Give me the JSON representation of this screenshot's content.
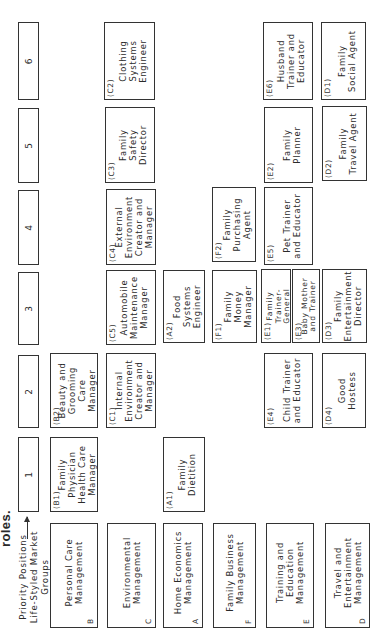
{
  "title": "roles.",
  "axis": {
    "label": "Priority Positions\nLife-Styled Market\nGroups"
  },
  "priorities": [
    "1",
    "2",
    "3",
    "4",
    "5",
    "6"
  ],
  "groups": [
    {
      "code": "B",
      "name": "Personal Care\nManagement"
    },
    {
      "code": "C",
      "name": "Environmental\nManagement"
    },
    {
      "code": "A",
      "name": "Home Economics\nManagement"
    },
    {
      "code": "F",
      "name": "Family Business\nManagement"
    },
    {
      "code": "E",
      "name": "Training and\nEducation\nManagement"
    },
    {
      "code": "D",
      "name": "Travel and\nEntertainment\nManagement"
    }
  ],
  "roles": {
    "B1": {
      "code": "(B1)",
      "name": "Family\nPhysician\nHealth Care\nManager"
    },
    "B2": {
      "code": "(B2)",
      "name": "Beauty and\nGrooming\nCare Manager"
    },
    "C1": {
      "code": "(C1)",
      "name": "Internal\nEnvironment\nCreator and\nManager"
    },
    "C5": {
      "code": "(C5)",
      "name": "Automobile\nMaintenance\nManager"
    },
    "C4": {
      "code": "(C4)",
      "name": "External\nEnvironment\nCreator and\nManager"
    },
    "C3": {
      "code": "(C3)",
      "name": "Family\nSafety\nDirector"
    },
    "C2": {
      "code": "(C2)",
      "name": "Clothing\nSystems\nEngineer"
    },
    "A1": {
      "code": "(A1)",
      "name": "Family\nDietition"
    },
    "A2": {
      "code": "(A2)",
      "name": "Food\nSystems\nEngineer"
    },
    "F1": {
      "code": "(F1)",
      "name": "Family\nMoney\nManager"
    },
    "F2": {
      "code": "(F2)",
      "name": "Family\nPurchasing\nAgent"
    },
    "E4": {
      "code": "(E4)",
      "name": "Child Trainer\nand Educator"
    },
    "E1": {
      "code": "(E1)",
      "name": "Family\nTrainer-\nGeneral"
    },
    "E3": {
      "code": "(E3)",
      "name": "Baby Mother\nand Trainer"
    },
    "E5": {
      "code": "(E5)",
      "name": "Pet Trainer\nand Educator"
    },
    "E2": {
      "code": "(E2)",
      "name": "Family\nPlanner"
    },
    "E6": {
      "code": "(E6)",
      "name": "Husband\nTrainer and\nEducator"
    },
    "D4": {
      "code": "(D4)",
      "name": "Good\nHostess"
    },
    "D3": {
      "code": "(D3)",
      "name": "Family\nEntertainment\nDirector"
    },
    "D2": {
      "code": "(D2)",
      "name": "Family\nTravel Agent"
    },
    "D1": {
      "code": "(D1)",
      "name": "Family\nSocial Agent"
    }
  }
}
